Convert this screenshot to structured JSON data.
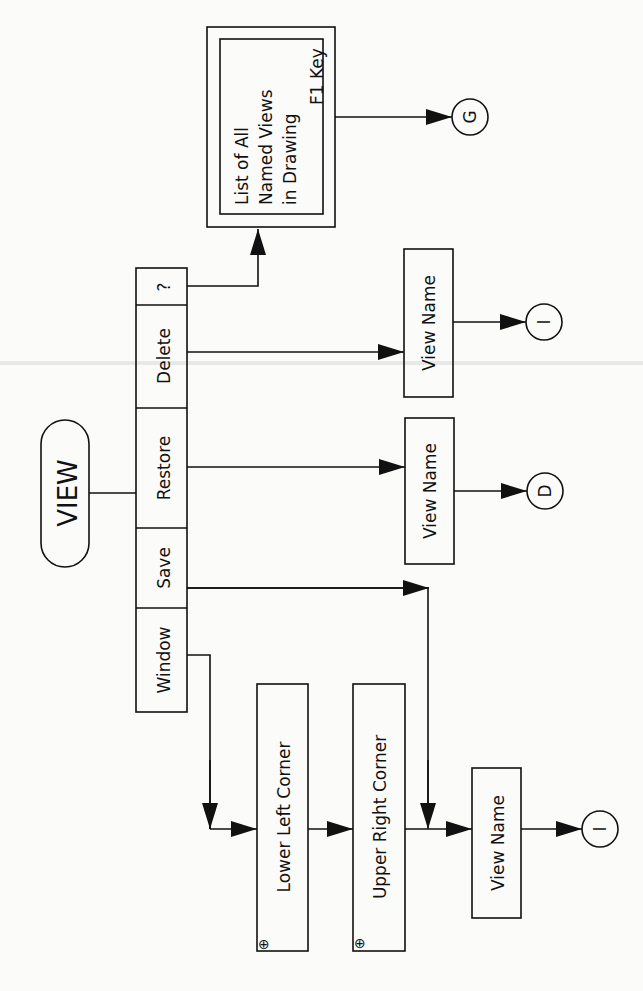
{
  "diagram": {
    "orientation": "rotated-90-ccw",
    "start": {
      "label": "VIEW",
      "shape": "terminator"
    },
    "menu": [
      {
        "id": "window",
        "label": "Window"
      },
      {
        "id": "save",
        "label": "Save"
      },
      {
        "id": "restore",
        "label": "Restore"
      },
      {
        "id": "delete",
        "label": "Delete"
      },
      {
        "id": "query",
        "label": "?"
      }
    ],
    "list_box": {
      "lines": [
        "List of All",
        "Named Views",
        "in Drawing"
      ],
      "shape": "double-border-box"
    },
    "f1_label": "F1 Key",
    "connectors": {
      "g": "G",
      "i_delete": "I",
      "d_restore": "D",
      "i_window": "I"
    },
    "boxes": {
      "delete_view_name": "View Name",
      "restore_view_name": "View Name",
      "lower_left": "Lower Left Corner",
      "upper_right": "Upper Right Corner",
      "window_view_name": "View Name"
    },
    "point_marker": "⊕",
    "edges": [
      [
        "VIEW",
        "menu"
      ],
      [
        "?",
        "List of All Named Views in Drawing"
      ],
      [
        "List of All Named Views in Drawing",
        "G",
        "F1 Key"
      ],
      [
        "Delete",
        "View Name (delete)"
      ],
      [
        "View Name (delete)",
        "I"
      ],
      [
        "Restore",
        "View Name (restore)"
      ],
      [
        "View Name (restore)",
        "D"
      ],
      [
        "Window",
        "Lower Left Corner"
      ],
      [
        "Lower Left Corner",
        "Upper Right Corner"
      ],
      [
        "Upper Right Corner",
        "View Name (window/save)"
      ],
      [
        "Save",
        "View Name (window/save)"
      ],
      [
        "View Name (window/save)",
        "I"
      ]
    ]
  }
}
